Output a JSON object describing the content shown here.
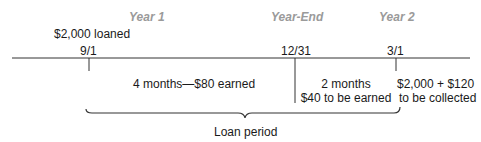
{
  "headers": {
    "year1": "Year 1",
    "year_end": "Year-End",
    "year2": "Year 2"
  },
  "loan_label": "$2,000 loaned",
  "dates": {
    "start": "9/1",
    "year_end": "12/31",
    "end": "3/1"
  },
  "segments": {
    "earned": "4 months—$80 earned",
    "to_earn_line1": "2 months",
    "to_earn_line2": "$40 to be earned",
    "collect_line1": "$2,000 + $120",
    "collect_line2": "to be collected"
  },
  "brace_label": "Loan period",
  "colors": {
    "text": "#1a1a1a",
    "header": "#9a9a9a",
    "line": "#333333"
  }
}
